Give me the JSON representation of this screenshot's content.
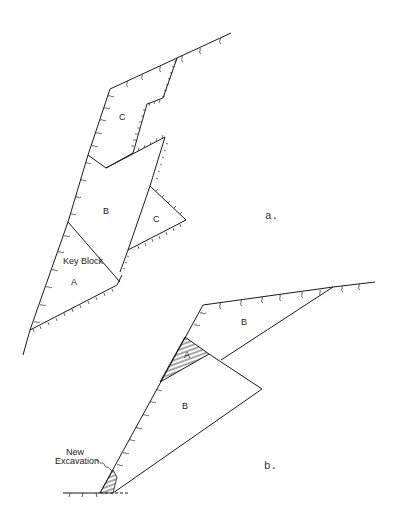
{
  "figure": {
    "panel_a": {
      "caption": "a.",
      "blocks": [
        {
          "id": "C-upper",
          "label": "C"
        },
        {
          "id": "B",
          "label": "B"
        },
        {
          "id": "C-right",
          "label": "C"
        },
        {
          "id": "key-block",
          "label": "Key Block"
        },
        {
          "id": "A",
          "label": "A"
        }
      ]
    },
    "panel_b": {
      "caption": "b.",
      "blocks": [
        {
          "id": "B-upper",
          "label": "B"
        },
        {
          "id": "A",
          "label": "A"
        },
        {
          "id": "B-lower",
          "label": "B"
        }
      ],
      "annotation": {
        "line1": "New",
        "line2": "Excavation"
      }
    }
  }
}
